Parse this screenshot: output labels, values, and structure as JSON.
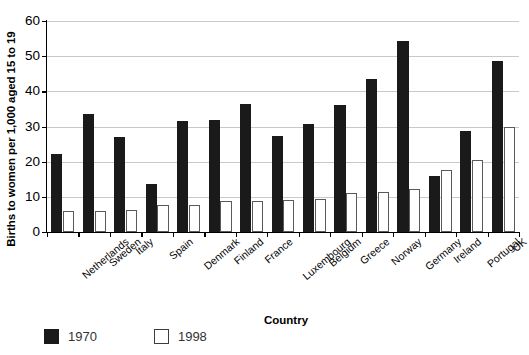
{
  "chart_data": {
    "type": "bar",
    "title": "",
    "xlabel": "Country",
    "ylabel": "Births to women per 1,000 aged 15 to 19",
    "ylim": [
      0,
      60
    ],
    "yticks": [
      0,
      10,
      20,
      30,
      40,
      50,
      60
    ],
    "grid": true,
    "legend_position": "below-left",
    "categories": [
      "Netherlands",
      "Sweden",
      "Italy",
      "Spain",
      "Denmark",
      "Finland",
      "France",
      "Luxembourg",
      "Belgium",
      "Greece",
      "Norway",
      "Germany",
      "Ireland",
      "Portugal",
      "UK"
    ],
    "series": [
      {
        "name": "1970",
        "color": "#1a1a1a",
        "values": [
          22.2,
          33.6,
          26.9,
          13.7,
          31.7,
          31.8,
          36.3,
          27.4,
          30.6,
          36.2,
          43.6,
          54.3,
          16.0,
          28.7,
          48.5
        ]
      },
      {
        "name": "1998",
        "color": "#ffffff",
        "values": [
          5.9,
          6.1,
          6.3,
          7.6,
          7.6,
          8.7,
          8.8,
          9.0,
          9.4,
          11.0,
          11.4,
          12.2,
          17.5,
          20.6,
          30.0
        ]
      }
    ]
  },
  "legend": {
    "items": [
      {
        "label": "1970",
        "style": "filled"
      },
      {
        "label": "1998",
        "style": "open"
      }
    ]
  }
}
